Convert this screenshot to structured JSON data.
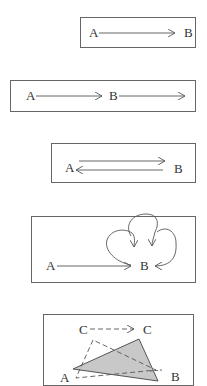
{
  "diagrams": [
    {
      "id": "single-move",
      "labels": {
        "start": "A",
        "end": "B"
      },
      "description": "Single arrow from A to B"
    },
    {
      "id": "continued-move",
      "labels": {
        "start": "A",
        "middle": "B"
      },
      "description": "Arrow from A to B, then arrow continuing beyond B"
    },
    {
      "id": "back-and-forth",
      "labels": {
        "start": "A",
        "end": "B"
      },
      "description": "Arrow from A to B and arrow back from B to A"
    },
    {
      "id": "repeated-arrival",
      "labels": {
        "start": "A",
        "end": "B"
      },
      "description": "Arrow from A to B with three looping arrows returning to B"
    },
    {
      "id": "triangle-shift",
      "labels": {
        "a": "A",
        "b": "B",
        "c_start": "C",
        "c_end": "C"
      },
      "description": "Dashed arrow from C to C; shaded triangle and dashed outline triangle between A, B, C",
      "fill_color": "#c8c8c8"
    }
  ]
}
